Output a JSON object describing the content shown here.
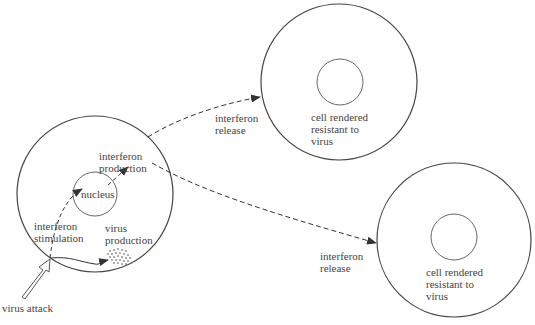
{
  "diagram": {
    "colors": {
      "line": "#444444",
      "background": "#ffffff"
    },
    "infected_cell": {
      "nucleus_label": "nucleus",
      "interferon_production": [
        "interferon",
        "production"
      ],
      "interferon_stimulation": [
        "interferon",
        "stimulation"
      ],
      "virus_production": [
        "virus",
        "production"
      ]
    },
    "virus_attack_label": "virus attack",
    "release_top": [
      "interferon",
      "release"
    ],
    "release_bottom": [
      "interferon",
      "release"
    ],
    "resistant_cell_top": [
      "cell rendered",
      "resistant to",
      "virus"
    ],
    "resistant_cell_bottom": [
      "cell rendered",
      "resistant to",
      "virus"
    ]
  }
}
